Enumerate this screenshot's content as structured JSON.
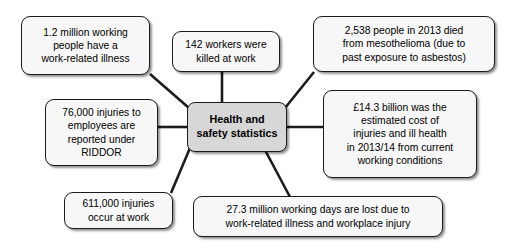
{
  "diagram": {
    "type": "mind-map",
    "title": "Health and safety statistics",
    "center": {
      "id": "center",
      "label": "Health and\nsafety statistics",
      "fill": "#d7d7d7",
      "border": "#1c1c1c"
    },
    "node_fill": "#f7f7f7",
    "node_border": "#1c1c1c",
    "connector_color": "#1c1c1c",
    "background": "#ffffff",
    "nodes": [
      {
        "id": "illness",
        "label": "1.2 million working\npeople have a\nwork-related illness",
        "position": "top-left"
      },
      {
        "id": "killed",
        "label": "142 workers were\nkilled at work",
        "position": "top-center"
      },
      {
        "id": "mesothelioma",
        "label": "2,538 people in 2013 died\nfrom mesothelioma (due to\npast exposure to asbestos)",
        "position": "top-right"
      },
      {
        "id": "riddor",
        "label": "76,000 injuries to\nemployees are\nreported under\nRIDDOR",
        "position": "middle-left"
      },
      {
        "id": "cost",
        "label": "£14.3 billion was the\nestimated cost of\ninjuries and ill health\nin 2013/14 from current\nworking conditions",
        "position": "middle-right"
      },
      {
        "id": "injuries",
        "label": "611,000 injuries\noccur at work",
        "position": "bottom-left"
      },
      {
        "id": "days-lost",
        "label": "27.3 million working days are lost due to\nwork-related illness and workplace injury",
        "position": "bottom-center"
      }
    ],
    "connections": [
      {
        "from": "center",
        "to": "illness"
      },
      {
        "from": "center",
        "to": "killed"
      },
      {
        "from": "center",
        "to": "mesothelioma"
      },
      {
        "from": "center",
        "to": "riddor"
      },
      {
        "from": "center",
        "to": "cost"
      },
      {
        "from": "center",
        "to": "injuries"
      },
      {
        "from": "center",
        "to": "days-lost"
      }
    ]
  }
}
